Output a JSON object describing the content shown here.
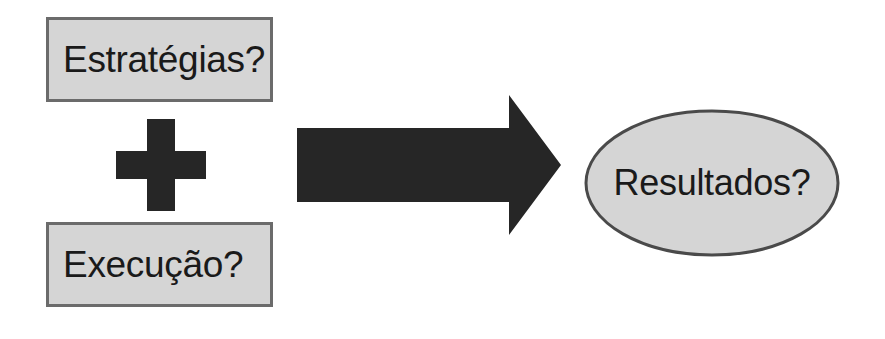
{
  "diagram": {
    "type": "equation-flow",
    "background_color": "#ffffff",
    "language": "pt-BR",
    "inputs": [
      {
        "id": "strategies",
        "shape": "rectangle",
        "label": "Estratégias?",
        "fill_color": "#d5d5d5",
        "border_color": "#6b6b6b"
      },
      {
        "id": "execution",
        "shape": "rectangle",
        "label": "Execução?",
        "fill_color": "#d5d5d5",
        "border_color": "#6b6b6b"
      }
    ],
    "operator": {
      "id": "plus",
      "symbol": "+",
      "name": "plus-sign",
      "color": "#262626"
    },
    "connector": {
      "id": "arrow",
      "name": "right-block-arrow",
      "direction": "right",
      "color": "#262626"
    },
    "output": {
      "id": "results",
      "shape": "ellipse",
      "label": "Resultados?",
      "fill_color": "#d5d5d5",
      "border_color": "#4a4a4a"
    }
  }
}
